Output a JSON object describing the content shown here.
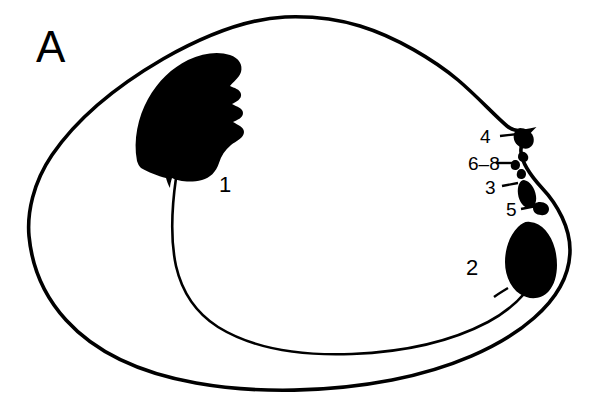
{
  "figure": {
    "panel_letter": "A",
    "background_color": "#ffffff",
    "ink_color": "#000000",
    "line_color": "#000000"
  },
  "labels": {
    "panel": {
      "text": "A",
      "x": 36,
      "y": 62
    },
    "scar_anterior": {
      "text": "1",
      "x": 219,
      "y": 192
    },
    "scar_posterior": {
      "text": "2",
      "x": 466,
      "y": 275
    },
    "hinge_4": {
      "text": "4",
      "x": 480,
      "y": 143
    },
    "hinge_6_8": {
      "text": "6–8",
      "x": 468,
      "y": 170
    },
    "hinge_3": {
      "text": "3",
      "x": 485,
      "y": 194
    },
    "hinge_5": {
      "text": "5",
      "x": 506,
      "y": 216
    }
  },
  "leaders": [
    {
      "name": "leader-4",
      "x1": 500,
      "y1": 136,
      "x2": 518,
      "y2": 134,
      "width": 2.4
    },
    {
      "name": "leader-6-8",
      "x1": 496,
      "y1": 163,
      "x2": 512,
      "y2": 163,
      "width": 2.4
    },
    {
      "name": "leader-3",
      "x1": 502,
      "y1": 186,
      "x2": 518,
      "y2": 183,
      "width": 2.4
    },
    {
      "name": "leader-5",
      "x1": 521,
      "y1": 209,
      "x2": 536,
      "y2": 206,
      "width": 2.4
    }
  ],
  "geometry": {
    "outline_path": "M 285 17 C 245 19 200 38 163 59 C 120 84 78 117 52 155 C 33 183 27 213 29 236 C 32 268 45 297 66 320 C 95 352 140 373 196 383 C 258 394 330 392 392 380 C 448 369 500 348 534 318 C 558 297 570 273 570 250 C 570 228 558 205 542 188 C 531 176 522 164 521 152 C 520 143 525 136 531 130 C 521 132 513 131 507 126 C 494 115 478 97 458 80 C 434 60 396 37 360 26 C 337 19 310 16 285 17 Z",
    "outline_width": 3.6,
    "pallial_path": "M 176 178 C 172 206 170 238 176 266 C 182 292 196 313 218 327 C 252 348 300 356 352 354 C 404 352 452 341 488 322 C 512 309 528 292 536 276",
    "pallial_width": 2.6,
    "anterior_scar_path": "M 137 161 C 133 140 138 117 148 99 C 158 81 172 68 188 60 C 203 53 218 51 230 55 C 239 58 243 65 241 72 C 239 78 233 82 230 86 C 234 88 240 89 241 94 C 242 99 236 102 232 104 C 237 107 243 108 243 113 C 243 118 237 120 233 122 C 238 125 244 127 244 132 C 244 138 236 141 231 145 C 225 150 221 156 219 163 C 216 172 210 178 202 180 C 190 183 178 181 172 178 C 171 181 170 185 170 188 C 168 185 167 181 166 178 C 158 176 148 172 141 168 C 139 166 138 164 137 161 Z",
    "posterior_scar_path": "M 530 222 C 542 223 551 234 555 249 C 559 265 557 282 549 291 C 541 300 529 300 520 294 C 511 288 505 276 505 262 C 505 248 510 235 518 227 C 522 223 526 221 530 222 Z",
    "posterior_scar_tail": "M 508 288 C 503 291 498 294 494 297",
    "hinge_teeth": [
      {
        "name": "tooth-4",
        "path": "M 520 128 C 525 128 531 131 533 136 C 535 141 533 146 529 148 C 524 150 518 147 515 142 C 512 137 514 129 520 128 Z"
      },
      {
        "name": "tooth-6",
        "path": "M 521 152 C 524 151 527 153 528 156 C 529 159 527 162 524 162 C 521 162 518 160 518 157 C 518 154 519 153 521 152 Z"
      },
      {
        "name": "tooth-7",
        "path": "M 515 160 C 518 160 520 162 520 165 C 520 168 518 170 515 170 C 512 170 510 167 511 164 C 511 162 513 160 515 160 Z"
      },
      {
        "name": "tooth-8",
        "path": "M 521 169 C 524 169 526 171 526 174 C 526 177 524 179 521 179 C 518 179 516 176 517 173 C 517 171 519 169 521 169 Z"
      },
      {
        "name": "tooth-3",
        "path": "M 524 180 C 530 181 535 188 536 196 C 537 203 534 208 529 208 C 524 208 519 202 518 194 C 517 186 520 180 524 180 Z"
      },
      {
        "name": "tooth-5",
        "path": "M 540 202 C 545 202 549 205 549 209 C 549 213 545 216 541 215 C 536 215 533 212 533 208 C 533 204 536 202 540 202 Z"
      }
    ]
  },
  "structures": [
    {
      "id": "1",
      "name": "anterior-adductor-muscle-scar"
    },
    {
      "id": "2",
      "name": "posterior-adductor-muscle-scar"
    },
    {
      "id": "3",
      "name": "hinge-tooth-3"
    },
    {
      "id": "4",
      "name": "hinge-tooth-4"
    },
    {
      "id": "5",
      "name": "hinge-tooth-5"
    },
    {
      "id": "6–8",
      "name": "hinge-teeth-6-to-8"
    }
  ]
}
